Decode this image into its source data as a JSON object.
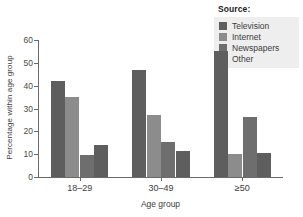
{
  "chart_data": {
    "type": "bar",
    "title": "",
    "xlabel": "Age group",
    "ylabel": "Percentage within age group",
    "categories": [
      "18–29",
      "30–49",
      "≥50"
    ],
    "series": [
      {
        "name": "Television",
        "values": [
          42,
          47,
          55
        ],
        "color": "#5e5e5e"
      },
      {
        "name": "Internet",
        "values": [
          35,
          27,
          10
        ],
        "color": "#8c8c8c"
      },
      {
        "name": "Newspapers",
        "values": [
          9.5,
          15.5,
          26.5
        ],
        "color": "#6e6e6e"
      },
      {
        "name": "Other",
        "values": [
          14,
          11.5,
          10.5
        ],
        "color": "#5e5e5e"
      }
    ],
    "ylim": [
      0,
      60
    ],
    "yticks": [
      0,
      10,
      20,
      30,
      40,
      50,
      60
    ],
    "ytick_labels": [
      "0",
      "10",
      "20",
      "30",
      "40",
      "50",
      "60"
    ],
    "grid": false,
    "legend_position": "top-right"
  },
  "legend": {
    "title": "Source:",
    "entries": [
      {
        "label": "Television",
        "color": "#5e5e5e"
      },
      {
        "label": "Internet",
        "color": "#8c8c8c"
      },
      {
        "label": "Newspapers",
        "color": "#6e6e6e"
      },
      {
        "label": "Other",
        "color": "#5e5e5e"
      }
    ]
  },
  "axes": {
    "y_title": "Percentage within age group",
    "x_title": "Age group",
    "y_tick_0": "0",
    "y_tick_1": "10",
    "y_tick_2": "20",
    "y_tick_3": "30",
    "y_tick_4": "40",
    "y_tick_5": "50",
    "y_tick_6": "60",
    "x_tick_0": "18–29",
    "x_tick_1": "30–49",
    "x_tick_2": "≥50"
  },
  "colors": {
    "axis": "#6a6a6a",
    "text": "#3c3c3c",
    "legend_background": "#eeeeee",
    "plot_background": "#ffffff"
  }
}
